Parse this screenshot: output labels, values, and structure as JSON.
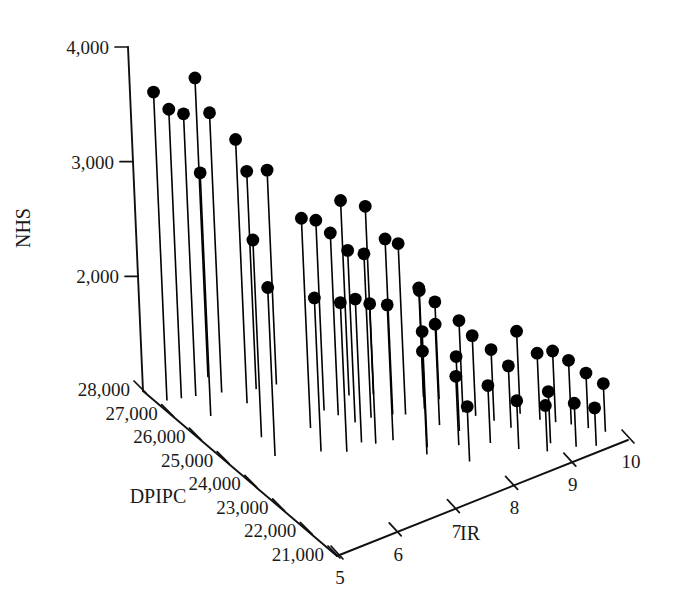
{
  "chart_data": {
    "type": "scatter",
    "subtype": "3d-stem-scatter",
    "title": "",
    "xlabel": "IR",
    "ylabel": "DPIPC",
    "zlabel": "NHS",
    "grid": false,
    "legend": "none",
    "axes": {
      "ir": {
        "label": "IR",
        "ticks": [
          "5",
          "6",
          "7",
          "8",
          "9",
          "10"
        ],
        "values": [
          5,
          6,
          7,
          8,
          9,
          10
        ],
        "range": [
          5,
          10
        ]
      },
      "dpipc": {
        "label": "DPIPC",
        "ticks": [
          "28,000",
          "27,000",
          "26,000",
          "25,000",
          "24,000",
          "23,000",
          "22,000",
          "21,000"
        ],
        "values": [
          28000,
          27000,
          26000,
          25000,
          24000,
          23000,
          22000,
          21000
        ],
        "range": [
          21000,
          28000
        ]
      },
      "nhs": {
        "label": "NHS",
        "ticks": [
          "2,000",
          "3,000",
          "4,000"
        ],
        "values": [
          2000,
          3000,
          4000
        ],
        "range": [
          1000,
          4000
        ]
      }
    },
    "points": [
      {
        "ir": 5.15,
        "dpipc": 27450,
        "nhs": 3690
      },
      {
        "ir": 5.35,
        "dpipc": 27350,
        "nhs": 3520
      },
      {
        "ir": 5.55,
        "dpipc": 27250,
        "nhs": 3460
      },
      {
        "ir": 5.45,
        "dpipc": 26500,
        "nhs": 3120
      },
      {
        "ir": 5.95,
        "dpipc": 27650,
        "nhs": 3610
      },
      {
        "ir": 5.9,
        "dpipc": 27050,
        "nhs": 3440
      },
      {
        "ir": 6.05,
        "dpipc": 26450,
        "nhs": 3300
      },
      {
        "ir": 5.75,
        "dpipc": 25300,
        "nhs": 2720
      },
      {
        "ir": 6.35,
        "dpipc": 26750,
        "nhs": 2900
      },
      {
        "ir": 6.65,
        "dpipc": 26650,
        "nhs": 2870
      },
      {
        "ir": 6.45,
        "dpipc": 25000,
        "nhs": 2830
      },
      {
        "ir": 6.85,
        "dpipc": 25350,
        "nhs": 2660
      },
      {
        "ir": 6.95,
        "dpipc": 25050,
        "nhs": 2590
      },
      {
        "ir": 7.05,
        "dpipc": 24650,
        "nhs": 2500
      },
      {
        "ir": 6.85,
        "dpipc": 24000,
        "nhs": 2250
      },
      {
        "ir": 7.0,
        "dpipc": 23800,
        "nhs": 2220
      },
      {
        "ir": 7.35,
        "dpipc": 25500,
        "nhs": 2700
      },
      {
        "ir": 7.3,
        "dpipc": 24600,
        "nhs": 2430
      },
      {
        "ir": 7.25,
        "dpipc": 23700,
        "nhs": 2180
      },
      {
        "ir": 7.65,
        "dpipc": 25250,
        "nhs": 2640
      },
      {
        "ir": 7.6,
        "dpipc": 24450,
        "nhs": 2530
      },
      {
        "ir": 7.75,
        "dpipc": 24300,
        "nhs": 2490
      },
      {
        "ir": 7.55,
        "dpipc": 23100,
        "nhs": 2010
      },
      {
        "ir": 8.05,
        "dpipc": 24250,
        "nhs": 2030
      },
      {
        "ir": 8.2,
        "dpipc": 24600,
        "nhs": 1950
      },
      {
        "ir": 8.35,
        "dpipc": 24350,
        "nhs": 1850
      },
      {
        "ir": 8.15,
        "dpipc": 23200,
        "nhs": 1650
      },
      {
        "ir": 8.45,
        "dpipc": 23700,
        "nhs": 1800
      },
      {
        "ir": 8.55,
        "dpipc": 23450,
        "nhs": 1700
      },
      {
        "ir": 8.35,
        "dpipc": 22500,
        "nhs": 1500
      },
      {
        "ir": 8.7,
        "dpipc": 23100,
        "nhs": 1620
      },
      {
        "ir": 8.8,
        "dpipc": 22700,
        "nhs": 1540
      },
      {
        "ir": 8.6,
        "dpipc": 22000,
        "nhs": 1420
      },
      {
        "ir": 9.1,
        "dpipc": 23000,
        "nhs": 1720
      },
      {
        "ir": 9.25,
        "dpipc": 22600,
        "nhs": 1580
      },
      {
        "ir": 9.05,
        "dpipc": 21800,
        "nhs": 1450
      },
      {
        "ir": 9.4,
        "dpipc": 22350,
        "nhs": 1620
      },
      {
        "ir": 9.55,
        "dpipc": 22100,
        "nhs": 1560
      },
      {
        "ir": 9.3,
        "dpipc": 21400,
        "nhs": 1380
      },
      {
        "ir": 9.7,
        "dpipc": 21800,
        "nhs": 1480
      },
      {
        "ir": 9.55,
        "dpipc": 21200,
        "nhs": 1330
      },
      {
        "ir": 7.95,
        "dpipc": 22800,
        "nhs": 1600
      },
      {
        "ir": 7.85,
        "dpipc": 22200,
        "nhs": 1480
      },
      {
        "ir": 8.9,
        "dpipc": 21600,
        "nhs": 1400
      },
      {
        "ir": 6.25,
        "dpipc": 24200,
        "nhs": 2340
      },
      {
        "ir": 6.55,
        "dpipc": 23900,
        "nhs": 2300
      },
      {
        "ir": 7.45,
        "dpipc": 22900,
        "nhs": 1900
      },
      {
        "ir": 8.0,
        "dpipc": 23600,
        "nhs": 1880
      },
      {
        "ir": 9.85,
        "dpipc": 21500,
        "nhs": 1420
      },
      {
        "ir": 5.65,
        "dpipc": 24600,
        "nhs": 2470
      }
    ]
  },
  "labels": {
    "nhs_axis_title": "NHS",
    "dpipc_axis_title": "DPIPC",
    "ir_axis_title": "IR",
    "nhs_ticks": [
      "4,000",
      "3,000",
      "2,000"
    ],
    "dpipc_ticks": [
      "28,000",
      "27,000",
      "26,000",
      "25,000",
      "24,000",
      "23,000",
      "22,000",
      "21,000"
    ],
    "ir_ticks": [
      "5",
      "6",
      "7",
      "8",
      "9",
      "10"
    ]
  },
  "colors": {
    "ink": "#101010",
    "marker": "#000000",
    "background": "#ffffff"
  }
}
